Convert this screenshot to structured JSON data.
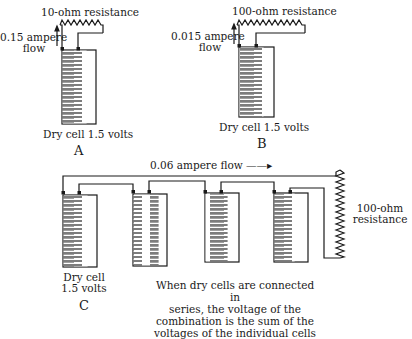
{
  "panel_a": {
    "letter": "A",
    "resistance_label": "10-ohm resistance",
    "current_line1": "0.15 ampere",
    "current_line2": "flow",
    "cell_label": "Dry cell 1.5 volts"
  },
  "panel_b": {
    "letter": "B",
    "resistance_label": "100-ohm resistance",
    "current_line1": "0.015 ampere",
    "current_line2": "flow",
    "cell_label": "Dry cell 1.5 volts"
  },
  "panel_c": {
    "letter": "C",
    "flow_label": "0.06 ampere flow ——▸",
    "resistance_line1": "100-ohm",
    "resistance_line2": "resistance",
    "cell_line1": "Dry cell",
    "cell_line2": "1.5 volts",
    "cell_count": 4,
    "caption_lines": [
      "When dry cells are connected in",
      "series, the voltage of the",
      "combination is the sum of the",
      "voltages of the individual cells"
    ]
  },
  "colors": {
    "ink": "#1a1a1a",
    "cell_fill": "#8a8a8a",
    "background": "#ffffff"
  }
}
